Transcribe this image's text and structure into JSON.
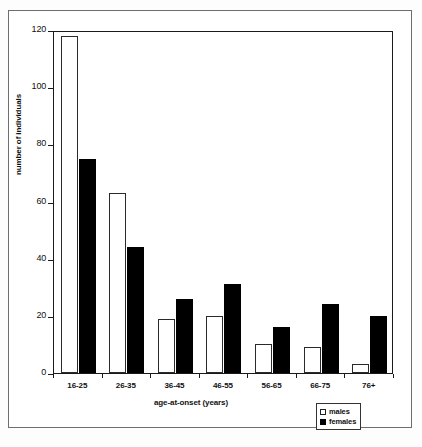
{
  "chart_data": {
    "type": "bar",
    "title": "",
    "xlabel": "age-at-onset (years)",
    "ylabel": "number of individuals",
    "categories": [
      "16-25",
      "26-35",
      "36-45",
      "46-55",
      "56-65",
      "66-75",
      "76+"
    ],
    "series": [
      {
        "name": "males",
        "values": [
          118,
          63,
          19,
          20,
          10,
          9,
          3
        ]
      },
      {
        "name": "females",
        "values": [
          75,
          44,
          26,
          31,
          16,
          24,
          20
        ]
      }
    ],
    "ylim": [
      0,
      120
    ],
    "yticks": [
      0,
      20,
      40,
      60,
      80,
      100,
      120
    ],
    "ytick_labels": [
      "0",
      "20",
      "40",
      "60",
      "80",
      "100",
      "120"
    ],
    "grid": false,
    "legend_position": "bottom-right",
    "colors": {
      "males": "#ffffff",
      "females": "#000000",
      "axis": "#1a1a1a",
      "frame": "#6e6e6e"
    }
  },
  "legend": {
    "entries": [
      {
        "label": "males",
        "swatch": "open-square"
      },
      {
        "label": "females",
        "swatch": "filled-square"
      }
    ]
  }
}
